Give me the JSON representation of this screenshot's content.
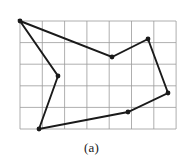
{
  "figure": {
    "caption": "(a)",
    "background_color": "#ffffff"
  },
  "grid": {
    "line_color": "#9a9a9a",
    "line_width": 0.8,
    "x_start": 20,
    "y_start": 21,
    "cell_width": 22.3,
    "cell_height": 21.6,
    "columns": 7,
    "rows": 5,
    "x_end": 176,
    "y_end": 129,
    "vertical_lines_x": [
      20,
      42.3,
      64.6,
      86.9,
      109.2,
      131.5,
      153.8,
      176.1
    ],
    "horizontal_lines_y": [
      21,
      42.6,
      64.2,
      85.8,
      107.4,
      129
    ]
  },
  "chart_data": {
    "type": "scatter",
    "title": "(a)",
    "xlabel": "",
    "ylabel": "",
    "grid": true,
    "legend_position": "none",
    "shape": "closed-polygon",
    "vertex_count": 7,
    "stroke_color": "#1a1a1a",
    "stroke_width": 1.9,
    "marker_color": "#1a1a1a",
    "marker_radius": 2.4,
    "vertices": [
      {
        "name": "top-left",
        "x": 20,
        "y": 21,
        "grid_col": 0,
        "grid_row": 0
      },
      {
        "name": "mid-notch",
        "x": 112,
        "y": 57,
        "grid_col": 4.1,
        "grid_row": 1.7
      },
      {
        "name": "top-right",
        "x": 148,
        "y": 39,
        "grid_col": 5.7,
        "grid_row": 0.8
      },
      {
        "name": "right-mid",
        "x": 168,
        "y": 93,
        "grid_col": 6.6,
        "grid_row": 3.3
      },
      {
        "name": "bottom-mid",
        "x": 128,
        "y": 112,
        "grid_col": 4.8,
        "grid_row": 4.2
      },
      {
        "name": "bottom-left",
        "x": 39,
        "y": 129,
        "grid_col": 0.85,
        "grid_row": 5.0
      },
      {
        "name": "left-mid",
        "x": 58,
        "y": 76,
        "grid_col": 1.7,
        "grid_row": 2.5
      }
    ],
    "edges": [
      {
        "from": "top-left",
        "to": "mid-notch"
      },
      {
        "from": "mid-notch",
        "to": "top-right"
      },
      {
        "from": "top-right",
        "to": "right-mid"
      },
      {
        "from": "right-mid",
        "to": "bottom-mid"
      },
      {
        "from": "bottom-mid",
        "to": "bottom-left"
      },
      {
        "from": "bottom-left",
        "to": "left-mid"
      },
      {
        "from": "left-mid",
        "to": "top-left"
      }
    ]
  }
}
